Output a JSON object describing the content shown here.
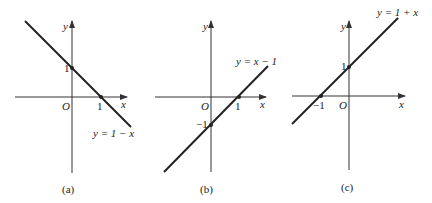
{
  "panels": [
    {
      "caption": "(a)",
      "equation": "y = 1 − x",
      "y_label": "y",
      "x_label": "x",
      "origin": "O",
      "x_tick": "1",
      "y_tick": "1"
    },
    {
      "caption": "(b)",
      "equation": "y = x − 1",
      "y_label": "y",
      "x_label": "x",
      "origin": "O",
      "x_tick": "1",
      "y_tick": "−1"
    },
    {
      "caption": "(c)",
      "equation": "y = 1 + x",
      "y_label": "y",
      "x_label": "x",
      "origin": "O",
      "x_tick": "−1",
      "y_tick": "1"
    }
  ],
  "colors": {
    "line": "#222222",
    "axis": "#333333"
  }
}
